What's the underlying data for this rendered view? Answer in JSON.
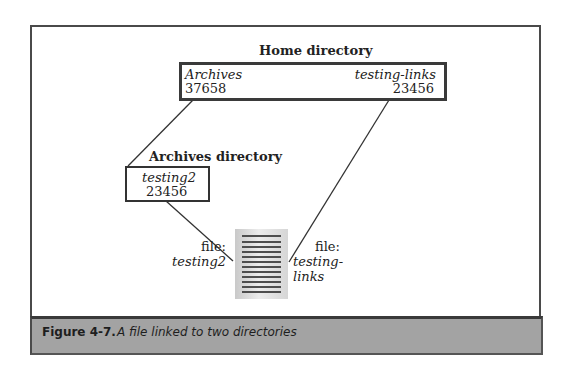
{
  "diagram": {
    "home_directory": {
      "title": "Home directory",
      "entries": [
        {
          "name": "Archives",
          "inode": "37658"
        },
        {
          "name": "testing-links",
          "inode": "23456"
        }
      ]
    },
    "archives_directory": {
      "title": "Archives directory",
      "entries": [
        {
          "name": "testing2",
          "inode": "23456"
        }
      ]
    },
    "file_links": [
      {
        "label": "file:",
        "name": "testing2"
      },
      {
        "label": "file:",
        "name": "testing-links"
      }
    ],
    "icons": {
      "file": "document-icon"
    }
  },
  "caption": {
    "label": "Figure 4-7.",
    "text": "A file linked to two directories"
  },
  "colors": {
    "frame": "#4a4a4a",
    "caption_band": "#a3a3a3",
    "box_border": "#333333",
    "line": "#333333"
  }
}
